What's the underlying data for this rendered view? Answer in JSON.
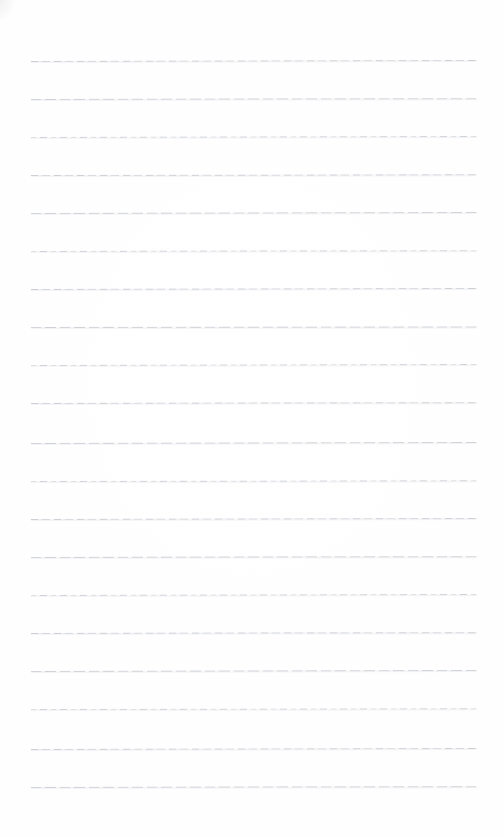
{
  "document": {
    "kind": "ruled-paper-sheet",
    "title": "",
    "header_text": "",
    "footer_text": "",
    "body_text": "",
    "is_blank": true,
    "page_width": 504,
    "page_height": 837,
    "background_color": "#fefefe"
  },
  "ruling": {
    "line_color": "#c6c9cf",
    "line_color_faint": "#dbdde2",
    "line_thickness_px": 1,
    "line_count": 20,
    "first_line_y": 61,
    "line_spacing_px": 38.1,
    "line_left_x": 31,
    "line_right_x": 477,
    "line_length_px": 446,
    "left_margin_rule": false,
    "right_margin_rule": false,
    "top_margin_px": 61,
    "bottom_margin_px": 50
  },
  "lines": [
    {
      "index": 1,
      "y": 61,
      "tilt_deg": -0.13,
      "text": ""
    },
    {
      "index": 2,
      "y": 99,
      "tilt_deg": -0.1,
      "text": ""
    },
    {
      "index": 3,
      "y": 137,
      "tilt_deg": -0.14,
      "text": ""
    },
    {
      "index": 4,
      "y": 175,
      "tilt_deg": -0.09,
      "text": ""
    },
    {
      "index": 5,
      "y": 213,
      "tilt_deg": -0.12,
      "text": ""
    },
    {
      "index": 6,
      "y": 251,
      "tilt_deg": -0.11,
      "text": ""
    },
    {
      "index": 7,
      "y": 289,
      "tilt_deg": -0.14,
      "text": ""
    },
    {
      "index": 8,
      "y": 327,
      "tilt_deg": -0.08,
      "text": ""
    },
    {
      "index": 9,
      "y": 365,
      "tilt_deg": -0.12,
      "text": ""
    },
    {
      "index": 10,
      "y": 403,
      "tilt_deg": -0.1,
      "text": ""
    },
    {
      "index": 11,
      "y": 443,
      "tilt_deg": -0.13,
      "text": ""
    },
    {
      "index": 12,
      "y": 481,
      "tilt_deg": -0.09,
      "text": ""
    },
    {
      "index": 13,
      "y": 519,
      "tilt_deg": -0.12,
      "text": ""
    },
    {
      "index": 14,
      "y": 557,
      "tilt_deg": -0.11,
      "text": ""
    },
    {
      "index": 15,
      "y": 595,
      "tilt_deg": -0.14,
      "text": ""
    },
    {
      "index": 16,
      "y": 633,
      "tilt_deg": -0.1,
      "text": ""
    },
    {
      "index": 17,
      "y": 671,
      "tilt_deg": -0.13,
      "text": ""
    },
    {
      "index": 18,
      "y": 709,
      "tilt_deg": -0.09,
      "text": ""
    },
    {
      "index": 19,
      "y": 749,
      "tilt_deg": -0.12,
      "text": ""
    },
    {
      "index": 20,
      "y": 787,
      "tilt_deg": -0.11,
      "text": ""
    }
  ]
}
